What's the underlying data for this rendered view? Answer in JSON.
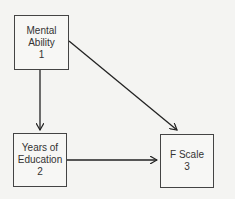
{
  "diagram": {
    "nodes": [
      {
        "id": 1,
        "line1": "Mental",
        "line2": "Ability",
        "number": "1"
      },
      {
        "id": 2,
        "line1": "Years of",
        "line2": "Education",
        "number": "2"
      },
      {
        "id": 3,
        "line1": "F Scale",
        "line2": "",
        "number": "3"
      }
    ],
    "edges": [
      {
        "from": 1,
        "to": 2
      },
      {
        "from": 1,
        "to": 3
      },
      {
        "from": 2,
        "to": 3
      }
    ],
    "colors": {
      "line": "#222222",
      "background": "#f4f4f2"
    }
  }
}
